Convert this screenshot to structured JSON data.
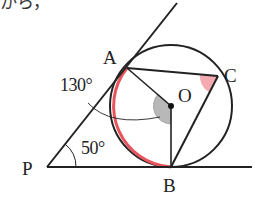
{
  "header_text": "から，",
  "points": {
    "A": "A",
    "B": "B",
    "C": "C",
    "O": "O",
    "P": "P"
  },
  "angles": {
    "arc_AB_label": "130°",
    "angle_P_label": "50°"
  },
  "colors": {
    "line": "#222222",
    "highlight_arc": "#e8545c",
    "angle_C_fill": "#f5a9b0",
    "angle_O_fill": "#b8b8b8"
  },
  "geometry": {
    "circle_center": [
      171,
      106
    ],
    "circle_radius": 61,
    "A": [
      127,
      68
    ],
    "B": [
      171,
      167
    ],
    "C": [
      218,
      76
    ],
    "P": [
      47,
      167
    ]
  }
}
